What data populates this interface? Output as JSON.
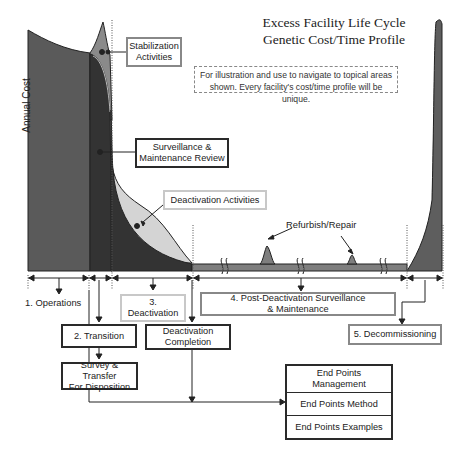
{
  "title": {
    "line1": "Excess Facility Life Cycle",
    "line2": "Genetic Cost/Time Profile"
  },
  "note": {
    "line1": "For illustration and use to navigate to topical areas",
    "line2": "shown. Every facility's cost/time profile will be unique."
  },
  "axis": {
    "ylabel": "Annual Cost"
  },
  "callouts": {
    "stabilization": {
      "line1": "Stabilization",
      "line2": "Activities"
    },
    "surveillance_review": {
      "line1": "Surveillance &",
      "line2": "Maintenance Review"
    },
    "deactivation_activities": "Deactivation Activities",
    "refurbish": "Refurbish/Repair"
  },
  "phases": [
    {
      "id": "operations",
      "label": "1. Operations"
    },
    {
      "id": "transition",
      "label": "2. Transition"
    },
    {
      "id": "deactivation",
      "line1": "3.",
      "line2": "Deactivation"
    },
    {
      "id": "post_deactivation",
      "line1": "4. Post-Deactivation Surveillance",
      "line2": "& Maintenance"
    },
    {
      "id": "decommissioning",
      "label": "5. Decommissioning"
    }
  ],
  "process_boxes": {
    "deactivation_completion": {
      "line1": "Deactivation",
      "line2": "Completion"
    },
    "survey_transfer": {
      "line1": "Survey & Transfer",
      "line2": "For Disposition"
    }
  },
  "end_points": {
    "management": {
      "line1": "End Points",
      "line2": "Management"
    },
    "method": "End Points Method",
    "examples": "End Points Examples"
  },
  "colors": {
    "operations_fill": "#5a5a5a",
    "transition_fill": "#3a3a3a",
    "stabilization_fill": "#8a8a8a",
    "deactivation_fill": "#d4d4d4",
    "surveillance_fill": "#7e7e7e",
    "decommissioning_fill": "#5e5e5e"
  }
}
